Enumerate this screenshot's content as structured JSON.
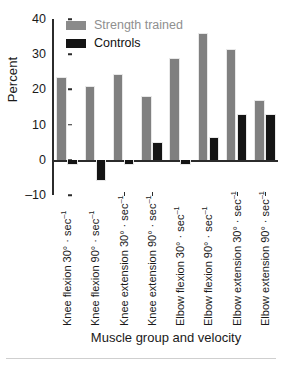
{
  "chart_data": {
    "type": "bar",
    "title": "",
    "subtitle": "",
    "xlabel": "Muscle group and velocity",
    "ylabel": "Percent",
    "ylim": [
      -10,
      40
    ],
    "yticks": [
      40,
      30,
      20,
      10,
      0,
      -10
    ],
    "ytick_labels": [
      "40",
      "30",
      "20",
      "10",
      "0",
      "–10"
    ],
    "grid": false,
    "legend_position": "top-left",
    "zero_line": true,
    "categories": [
      "Knee flexion 30° · sec⁻¹",
      "Knee flexion 90° · sec⁻¹",
      "Knee extension 30° · sec⁻¹",
      "Knee extension 90° · sec⁻¹",
      "Elbow flexion 30° · sec⁻¹",
      "Elbow flexion 90° · sec⁻¹",
      "Elbow extension 30° · sec⁻¹",
      "Elbow extension 90° · sec⁻¹"
    ],
    "series": [
      {
        "name": "Strength trained",
        "color": "#808080",
        "values": [
          23.5,
          21,
          24.5,
          18,
          29,
          36,
          31.5,
          17
        ]
      },
      {
        "name": "Controls",
        "color": "#141414",
        "values": [
          -1.5,
          -6,
          -1.5,
          5,
          -1.5,
          6.5,
          13,
          13
        ]
      }
    ]
  },
  "legend": {
    "items": [
      {
        "label": "Strength trained",
        "color": "#808080"
      },
      {
        "label": "Controls",
        "color": "#141414"
      }
    ]
  },
  "axes": {
    "y_title": "Percent",
    "x_title": "Muscle group and velocity"
  }
}
